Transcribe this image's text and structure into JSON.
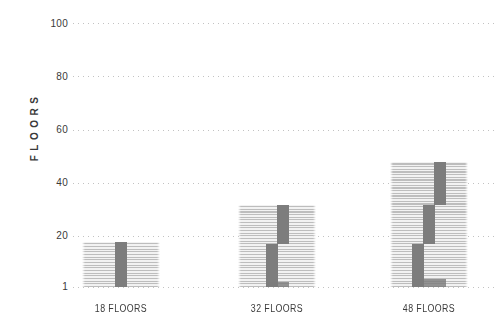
{
  "chart_data": {
    "type": "bar",
    "title": "",
    "xlabel": "",
    "ylabel": "FLOORS",
    "categories": [
      "18 FLOORS",
      "32 FLOORS",
      "48 FLOORS"
    ],
    "values": [
      18,
      32,
      48
    ],
    "ylim": [
      1,
      100
    ],
    "yticks": [
      100,
      80,
      60,
      40,
      20,
      1
    ],
    "ytick_labels": [
      "100",
      "80",
      "60",
      "40",
      "20",
      "1"
    ],
    "grid": "horizontal-dotted",
    "legend_position": "none",
    "bar_style": "horizontal stripe per floor with dark staggered elevator-shaft segments",
    "buildings": [
      {
        "label": "18 FLOORS",
        "floors": 18,
        "elevator_shafts": [
          {
            "from_floor": 1,
            "to_floor": 18
          }
        ],
        "ground_lobby": null
      },
      {
        "label": "32 FLOORS",
        "floors": 32,
        "elevator_shafts": [
          {
            "from_floor": 1,
            "to_floor": 17
          },
          {
            "from_floor": 17,
            "to_floor": 32
          }
        ],
        "ground_lobby": {
          "from_floor": 1,
          "to_floor": 3
        }
      },
      {
        "label": "48 FLOORS",
        "floors": 48,
        "elevator_shafts": [
          {
            "from_floor": 1,
            "to_floor": 17
          },
          {
            "from_floor": 17,
            "to_floor": 32
          },
          {
            "from_floor": 32,
            "to_floor": 48
          }
        ],
        "ground_lobby": {
          "from_floor": 1,
          "to_floor": 4
        }
      }
    ],
    "colors": {
      "background": "#ffffff",
      "bar_stripe_dark": "#bdbdbd",
      "bar_stripe_light": "#f2f2f2",
      "shaft": "#7d7d7d",
      "lobby": "#8a8a8a",
      "gridline": "#c2c2c2",
      "text": "#3a3a3a"
    }
  }
}
